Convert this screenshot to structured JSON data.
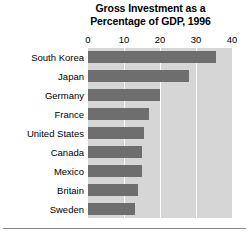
{
  "chart_data": {
    "type": "bar",
    "orientation": "horizontal",
    "title": "Gross Investment as a Percentage of GDP, 1996",
    "title_lines": [
      "Gross Investment as a",
      "Percentage of GDP, 1996"
    ],
    "xlabel": "",
    "ylabel": "",
    "xlim": [
      0,
      40
    ],
    "xticks": [
      0,
      10,
      20,
      30,
      40
    ],
    "xtick_labels": [
      "0",
      "10",
      "20",
      "30",
      "40"
    ],
    "grid": "vertical-white-gridlines",
    "legend": "none",
    "categories": [
      "South Korea",
      "Japan",
      "Germany",
      "France",
      "United States",
      "Canada",
      "Mexico",
      "Britain",
      "Sweden"
    ],
    "values": [
      35.5,
      28,
      20,
      17,
      15.5,
      15,
      15,
      14,
      13
    ],
    "colors": {
      "bar": "#6e6e6e",
      "plot_background": "#d6d6d6",
      "gridline": "#ffffff",
      "figure_background": "#ffffff",
      "text": "#000000",
      "rule": "#8a8a8a"
    }
  }
}
